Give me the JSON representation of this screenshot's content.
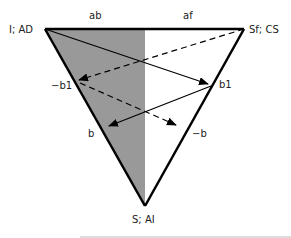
{
  "diagram": {
    "colors": {
      "shade": "#999999",
      "stroke": "#000000",
      "text": "#222222",
      "baseline": "#bbbbbb"
    },
    "vertices": {
      "top_left": {
        "label": "I; AD"
      },
      "top_right": {
        "label": "Sf; CS"
      },
      "bottom": {
        "label": "S; AI"
      }
    },
    "edge_labels": {
      "top_left_half": "ab",
      "top_right_half": "af",
      "left_edge_upper": "−b1",
      "left_edge_lower": "b",
      "right_edge_upper": "b1",
      "right_edge_lower": "−b"
    },
    "arrows": [
      {
        "from": "I; AD",
        "to": "b1",
        "style": "solid"
      },
      {
        "from": "Sf; CS",
        "to": "−b1",
        "style": "dashed"
      },
      {
        "from": "b1",
        "to": "b",
        "style": "solid"
      },
      {
        "from": "−b1",
        "to": "−b",
        "style": "dashed"
      }
    ]
  }
}
